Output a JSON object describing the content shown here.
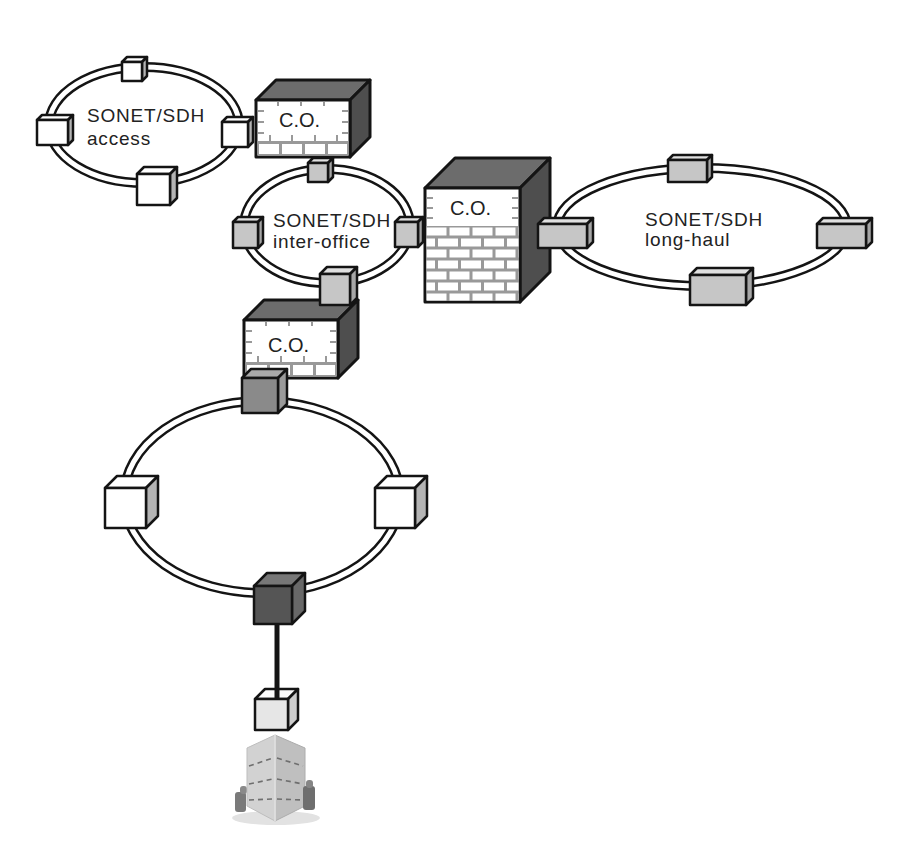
{
  "diagram": {
    "rings": {
      "access": {
        "title": "SONET/SDH",
        "subtitle": "access",
        "node_count": 4
      },
      "inter_office": {
        "title": "SONET/SDH",
        "subtitle": "inter-office",
        "node_count": 4
      },
      "long_haul": {
        "title": "SONET/SDH",
        "subtitle": "long-haul",
        "node_count": 4
      },
      "customer": {
        "title": "",
        "subtitle": "",
        "node_count": 4
      }
    },
    "central_offices": {
      "access_to_inter_office": {
        "label": "C.O."
      },
      "inter_office_to_long_haul": {
        "label": "C.O."
      },
      "inter_office_to_customer_ring": {
        "label": "C.O."
      }
    },
    "endpoint": {
      "type": "customer-building",
      "access_node": "terminal"
    },
    "palette": {
      "ring_line": "#141414",
      "node_white": "#ffffff",
      "node_light_grey": "#c6c6c6",
      "node_mid_grey": "#8a8a8a",
      "node_dark_grey": "#555555",
      "co_roof": "#6c6c6c",
      "co_side": "#4e4e4e",
      "brick_mortar": "#999999"
    }
  }
}
